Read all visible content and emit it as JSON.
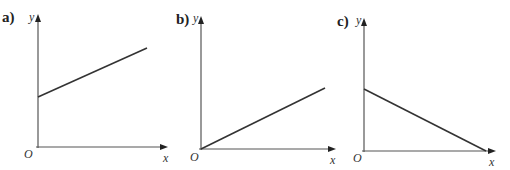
{
  "figure": {
    "panels": [
      {
        "id": "a",
        "label": "a)",
        "y_axis_label": "y",
        "x_axis_label": "x",
        "origin_label": "O",
        "description": "Straight line with positive gradient and positive y-intercept"
      },
      {
        "id": "b",
        "label": "b)",
        "y_axis_label": "y",
        "x_axis_label": "x",
        "origin_label": "O",
        "description": "Straight line with positive gradient passing through the origin"
      },
      {
        "id": "c",
        "label": "c)",
        "y_axis_label": "y",
        "x_axis_label": "x",
        "origin_label": "O",
        "description": "Straight line with negative gradient from positive y-intercept to x-axis"
      }
    ],
    "colors": {
      "axis": "#555555",
      "line": "#333333",
      "text": "#222222"
    }
  }
}
